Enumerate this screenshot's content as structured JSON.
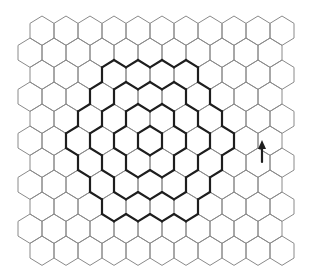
{
  "diagram": {
    "canvas": {
      "width": 311,
      "height": 278,
      "background": "#ffffff"
    },
    "grid": {
      "rows": 11,
      "origin_x": 42,
      "origin_y": 30.7,
      "col_spacing": 24,
      "row_spacing": 22,
      "hex_half_height": 14.67,
      "cols_even_row": 11,
      "cols_odd_row": 11,
      "line_color": "#8a8a8a"
    },
    "spiral": {
      "center_row": 5,
      "center_x": 150,
      "rings": [
        0,
        1,
        2,
        3
      ],
      "line_color": "#1e1e1e",
      "arrow": {
        "x": 262,
        "y": 148,
        "direction": "up",
        "icon": "arrow-up-icon"
      }
    }
  }
}
